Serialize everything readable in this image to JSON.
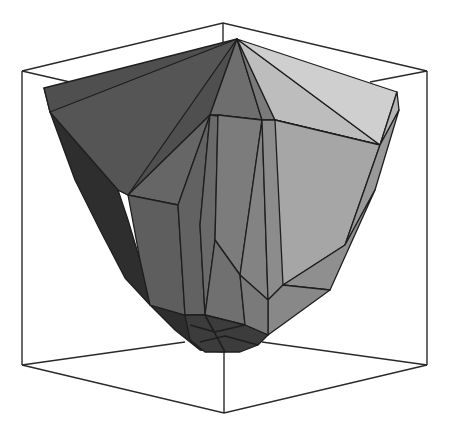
{
  "figure": {
    "title": "",
    "colors": {
      "background": "#ffffff",
      "edge": "#1e1e1e",
      "box": "#2a2a2a",
      "face_darkest": "#2e2e2e",
      "face_dark": "#4f4f4f",
      "face_mid_dark": "#5e5e5e",
      "face_mid": "#767676",
      "face_mid_light": "#8c8c8c",
      "face_light": "#a6a6a6",
      "face_lighter": "#bdbdbd",
      "face_lightest": "#cfcfcf"
    }
  },
  "bounding_box": {
    "top_back": [
      223,
      23
    ],
    "top_left": [
      22,
      71
    ],
    "top_right": [
      427,
      71
    ],
    "top_front": [
      224,
      120
    ],
    "bottom_left": [
      22,
      365
    ],
    "bottom_right": [
      427,
      365
    ],
    "bottom_front": [
      224,
      413
    ],
    "bottom_back_left": [
      185,
      342
    ],
    "bottom_back_right": [
      262,
      342
    ]
  },
  "polyhedron": {
    "apex": [
      237,
      39
    ],
    "left_rim": [
      44,
      88
    ],
    "right_rim": [
      397,
      92
    ],
    "bottom": [
      225,
      352
    ]
  }
}
